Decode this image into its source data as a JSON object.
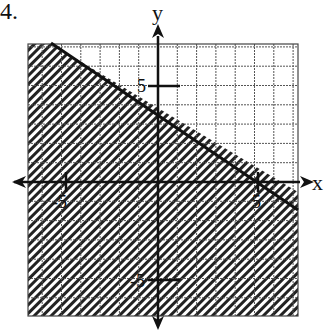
{
  "problem": {
    "number": "4."
  },
  "axes": {
    "x_label": "x",
    "y_label": "y",
    "tick_labels": {
      "x_neg": "-5",
      "x_pos": "5",
      "y_pos": "5",
      "y_neg": "-5"
    }
  },
  "colors": {
    "ink": "#111111",
    "grid": "#555555",
    "background": "#ffffff"
  },
  "chart_data": {
    "type": "area",
    "title": "",
    "xlabel": "x",
    "ylabel": "y",
    "xlim": [
      -7,
      7
    ],
    "ylim": [
      -7,
      7
    ],
    "grid": true,
    "grid_step": 1,
    "tick_labels": [
      {
        "axis": "x",
        "value": -5,
        "label": "-5"
      },
      {
        "axis": "x",
        "value": 5,
        "label": "5"
      },
      {
        "axis": "y",
        "value": 5,
        "label": "5"
      },
      {
        "axis": "y",
        "value": -5,
        "label": "-5"
      }
    ],
    "boundary_line": {
      "style": "solid",
      "slope": -0.6,
      "y_intercept": 3,
      "x_intercept": 5,
      "equation": "y = -3/5 x + 3",
      "points": [
        [
          -5,
          6
        ],
        [
          0,
          3
        ],
        [
          5,
          0
        ],
        [
          7,
          -1.2
        ]
      ]
    },
    "inequality": "y <= -3/5 x + 3",
    "shaded_region": "below line"
  }
}
